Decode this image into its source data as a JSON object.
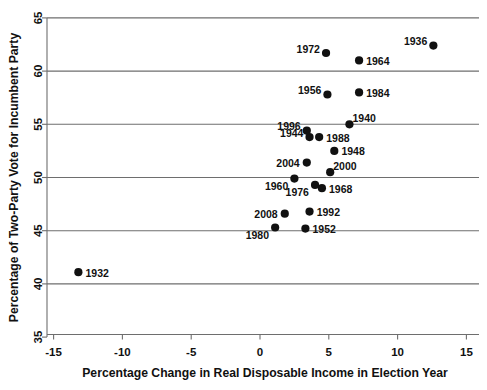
{
  "chart_data": {
    "type": "scatter",
    "title": "",
    "xlabel": "Percentage Change in Real Disposable Income in Election Year",
    "ylabel": "Percentage of Two-Party Vote for Incumbent Party",
    "xlim": [
      -16.5,
      16.0
    ],
    "ylim": [
      34.0,
      66.0
    ],
    "xticks": [
      -15,
      -10,
      -5,
      0,
      5,
      10,
      15
    ],
    "xtick_labels": [
      "-15",
      "-10",
      "-5",
      "0",
      "5",
      "10",
      "15"
    ],
    "yticks": [
      35,
      40,
      45,
      50,
      55,
      60,
      65
    ],
    "ytick_labels": [
      "35",
      "40",
      "45",
      "50",
      "55",
      "60",
      "65"
    ],
    "grid": true,
    "gridlines_y": [
      40,
      45,
      50,
      55,
      60,
      65
    ],
    "legend": "none",
    "point_color": "#111111",
    "grid_color": "#6e6e6e",
    "points": [
      {
        "label": "1932",
        "x": -13.2,
        "y": 41.1,
        "label_pos": "right"
      },
      {
        "label": "1936",
        "x": 12.6,
        "y": 62.4,
        "label_pos": "upper-left"
      },
      {
        "label": "1940",
        "x": 6.5,
        "y": 55.0,
        "label_pos": "upper-right"
      },
      {
        "label": "1944",
        "x": 3.6,
        "y": 53.8,
        "label_pos": "upper-left"
      },
      {
        "label": "1948",
        "x": 5.4,
        "y": 52.5,
        "label_pos": "right"
      },
      {
        "label": "1952",
        "x": 3.3,
        "y": 45.2,
        "label_pos": "right"
      },
      {
        "label": "1956",
        "x": 4.9,
        "y": 57.8,
        "label_pos": "upper-left"
      },
      {
        "label": "1960",
        "x": 2.5,
        "y": 49.9,
        "label_pos": "lower-left"
      },
      {
        "label": "1964",
        "x": 7.2,
        "y": 61.0,
        "label_pos": "right"
      },
      {
        "label": "1968",
        "x": 4.5,
        "y": 49.0,
        "label_pos": "right"
      },
      {
        "label": "1972",
        "x": 4.8,
        "y": 61.7,
        "label_pos": "upper-left"
      },
      {
        "label": "1976",
        "x": 4.0,
        "y": 49.3,
        "label_pos": "lower-left"
      },
      {
        "label": "1980",
        "x": 1.1,
        "y": 45.3,
        "label_pos": "lower-left"
      },
      {
        "label": "1984",
        "x": 7.2,
        "y": 58.0,
        "label_pos": "right"
      },
      {
        "label": "1988",
        "x": 4.3,
        "y": 53.8,
        "label_pos": "right"
      },
      {
        "label": "1992",
        "x": 3.6,
        "y": 46.8,
        "label_pos": "right"
      },
      {
        "label": "1996",
        "x": 3.4,
        "y": 54.4,
        "label_pos": "upper-left"
      },
      {
        "label": "2000",
        "x": 5.1,
        "y": 50.5,
        "label_pos": "upper-right"
      },
      {
        "label": "2004",
        "x": 3.4,
        "y": 51.4,
        "label_pos": "left"
      },
      {
        "label": "2008",
        "x": 1.8,
        "y": 46.6,
        "label_pos": "left"
      }
    ]
  }
}
